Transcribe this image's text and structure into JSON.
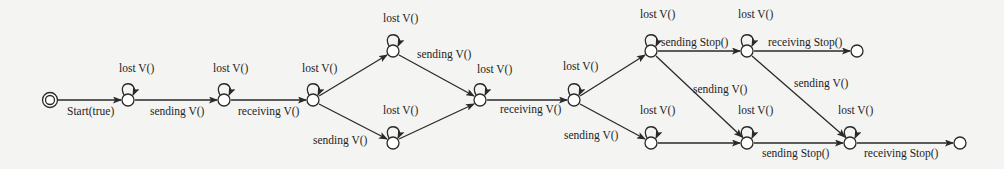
{
  "diagram": {
    "type": "state-transition-graph",
    "nodes": [
      {
        "id": "s0",
        "x": 50,
        "y": 100,
        "initial": true
      },
      {
        "id": "s1",
        "x": 128,
        "y": 100,
        "self_loop": "lost V()"
      },
      {
        "id": "s2",
        "x": 224,
        "y": 100,
        "self_loop": "lost V()"
      },
      {
        "id": "s3",
        "x": 313,
        "y": 100,
        "self_loop": "lost V()"
      },
      {
        "id": "s4",
        "x": 393,
        "y": 51,
        "self_loop": "lost V()"
      },
      {
        "id": "s5",
        "x": 393,
        "y": 143,
        "self_loop": "lost V()"
      },
      {
        "id": "s6",
        "x": 480,
        "y": 100,
        "self_loop": "lost V()"
      },
      {
        "id": "s7",
        "x": 574,
        "y": 100,
        "self_loop": "lost V()"
      },
      {
        "id": "s8",
        "x": 651,
        "y": 51,
        "self_loop": "lost V()"
      },
      {
        "id": "s9",
        "x": 747,
        "y": 51,
        "self_loop": "lost V()"
      },
      {
        "id": "s10",
        "x": 857,
        "y": 51
      },
      {
        "id": "s11",
        "x": 651,
        "y": 143,
        "self_loop": "lost V()"
      },
      {
        "id": "s12",
        "x": 747,
        "y": 143,
        "self_loop": "lost V()"
      },
      {
        "id": "s13",
        "x": 850,
        "y": 143,
        "self_loop": "lost V()"
      },
      {
        "id": "s14",
        "x": 960,
        "y": 143
      }
    ],
    "edges": [
      {
        "from": "s0",
        "to": "s1",
        "label": "Start(true)"
      },
      {
        "from": "s1",
        "to": "s2",
        "label": "sending V()"
      },
      {
        "from": "s2",
        "to": "s3",
        "label": "receiving V()"
      },
      {
        "from": "s3",
        "to": "s4",
        "label": ""
      },
      {
        "from": "s3",
        "to": "s5",
        "label": "sending V()"
      },
      {
        "from": "s4",
        "to": "s6",
        "label": "sending V()"
      },
      {
        "from": "s5",
        "to": "s6",
        "label": ""
      },
      {
        "from": "s6",
        "to": "s7",
        "label": "receiving V()"
      },
      {
        "from": "s7",
        "to": "s8",
        "label": ""
      },
      {
        "from": "s7",
        "to": "s11",
        "label": "sending V()"
      },
      {
        "from": "s8",
        "to": "s9",
        "label": "sending Stop()"
      },
      {
        "from": "s8",
        "to": "s12",
        "label": "sending V()"
      },
      {
        "from": "s9",
        "to": "s10",
        "label": "receiving Stop()"
      },
      {
        "from": "s9",
        "to": "s13",
        "label": "sending V()"
      },
      {
        "from": "s11",
        "to": "s12",
        "label": ""
      },
      {
        "from": "s12",
        "to": "s13",
        "label": "sending Stop()"
      },
      {
        "from": "s13",
        "to": "s14",
        "label": "receiving Stop()"
      }
    ],
    "labels": {
      "start": "Start(true)",
      "lost": "lost V()",
      "sending_v": "sending V()",
      "receiving_v": "receiving V()",
      "sending_stop": "sending Stop()",
      "receiving_stop": "receiving Stop()"
    },
    "colors": {
      "background": "#f4f4f2",
      "stroke": "#2a2a2a",
      "text": "#1e1e1e"
    }
  }
}
